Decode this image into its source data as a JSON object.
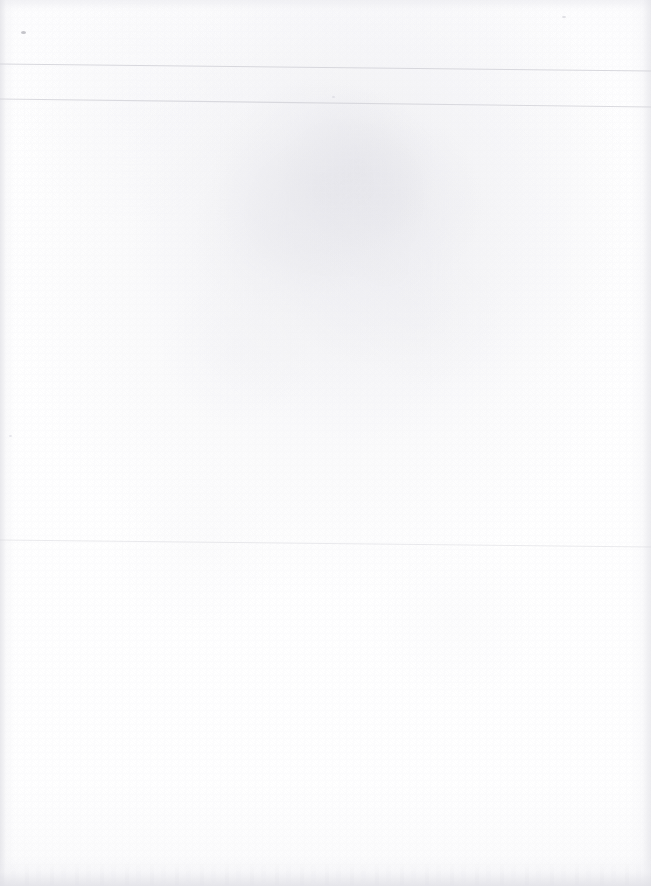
{
  "document": {
    "kind": "scanned-blank-page",
    "page_width": 651,
    "page_height": 886,
    "background_color": "#ffffff",
    "visible_text": "",
    "note": ""
  },
  "rules": {
    "stroke_color": "#d2d2d8",
    "count": 3,
    "lines": [
      {
        "name": "top-rule-1",
        "x1": 0,
        "y1": 64,
        "x2": 651,
        "y2": 71,
        "opacity": 0.85,
        "thickness": 1.1
      },
      {
        "name": "top-rule-2",
        "x1": 0,
        "y1": 99,
        "x2": 651,
        "y2": 107,
        "opacity": 0.8,
        "thickness": 1.1
      },
      {
        "name": "mid-rule-3",
        "x1": 0,
        "y1": 540,
        "x2": 651,
        "y2": 547,
        "opacity": 0.45,
        "thickness": 1.0
      }
    ]
  },
  "marks": {
    "specks": [
      {
        "name": "ink-speck-top-left",
        "x": 21,
        "y": 31
      },
      {
        "name": "paper-speck-upper-right",
        "x": 562,
        "y": 16
      },
      {
        "name": "paper-speck-mid-left",
        "x": 9,
        "y": 435
      },
      {
        "name": "paper-speck-mid-right",
        "x": 332,
        "y": 96
      }
    ]
  },
  "palette": {
    "paper": "#ffffff",
    "rule_line": "#d2d2d8",
    "edge_shadow": "#e4e4ea",
    "speck": "#969699"
  }
}
